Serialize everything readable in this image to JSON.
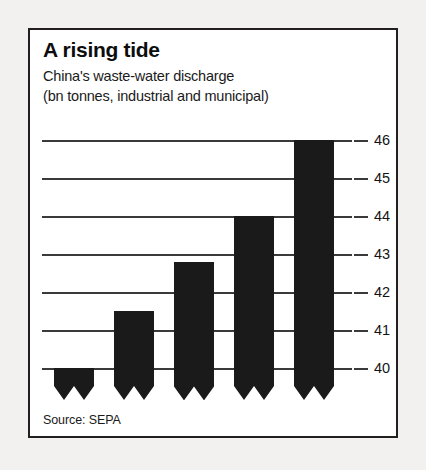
{
  "card": {
    "title": "A rising tide",
    "subtitle_lines": [
      "China's waste-water discharge",
      "(bn tonnes, industrial and municipal)"
    ],
    "source": "Source: SEPA"
  },
  "chart_data": {
    "type": "bar",
    "title": "A rising tide",
    "subtitle": "China's waste-water discharge (bn tonnes, industrial and municipal)",
    "categories": [
      "1999",
      "2000",
      "01",
      "02",
      "03"
    ],
    "values": [
      40.0,
      41.5,
      42.8,
      44.0,
      46.0
    ],
    "xlabel": "",
    "ylabel": "",
    "ylim": [
      39.4,
      46
    ],
    "yticks": [
      40,
      41,
      42,
      43,
      44,
      45,
      46
    ],
    "ytick_labels": [
      "40",
      "41",
      "42",
      "43",
      "44",
      "45",
      "46"
    ],
    "axis_truncated": true,
    "grid": true,
    "legend": false,
    "bar_color": "#1a1a1a",
    "source": "Source: SEPA"
  }
}
